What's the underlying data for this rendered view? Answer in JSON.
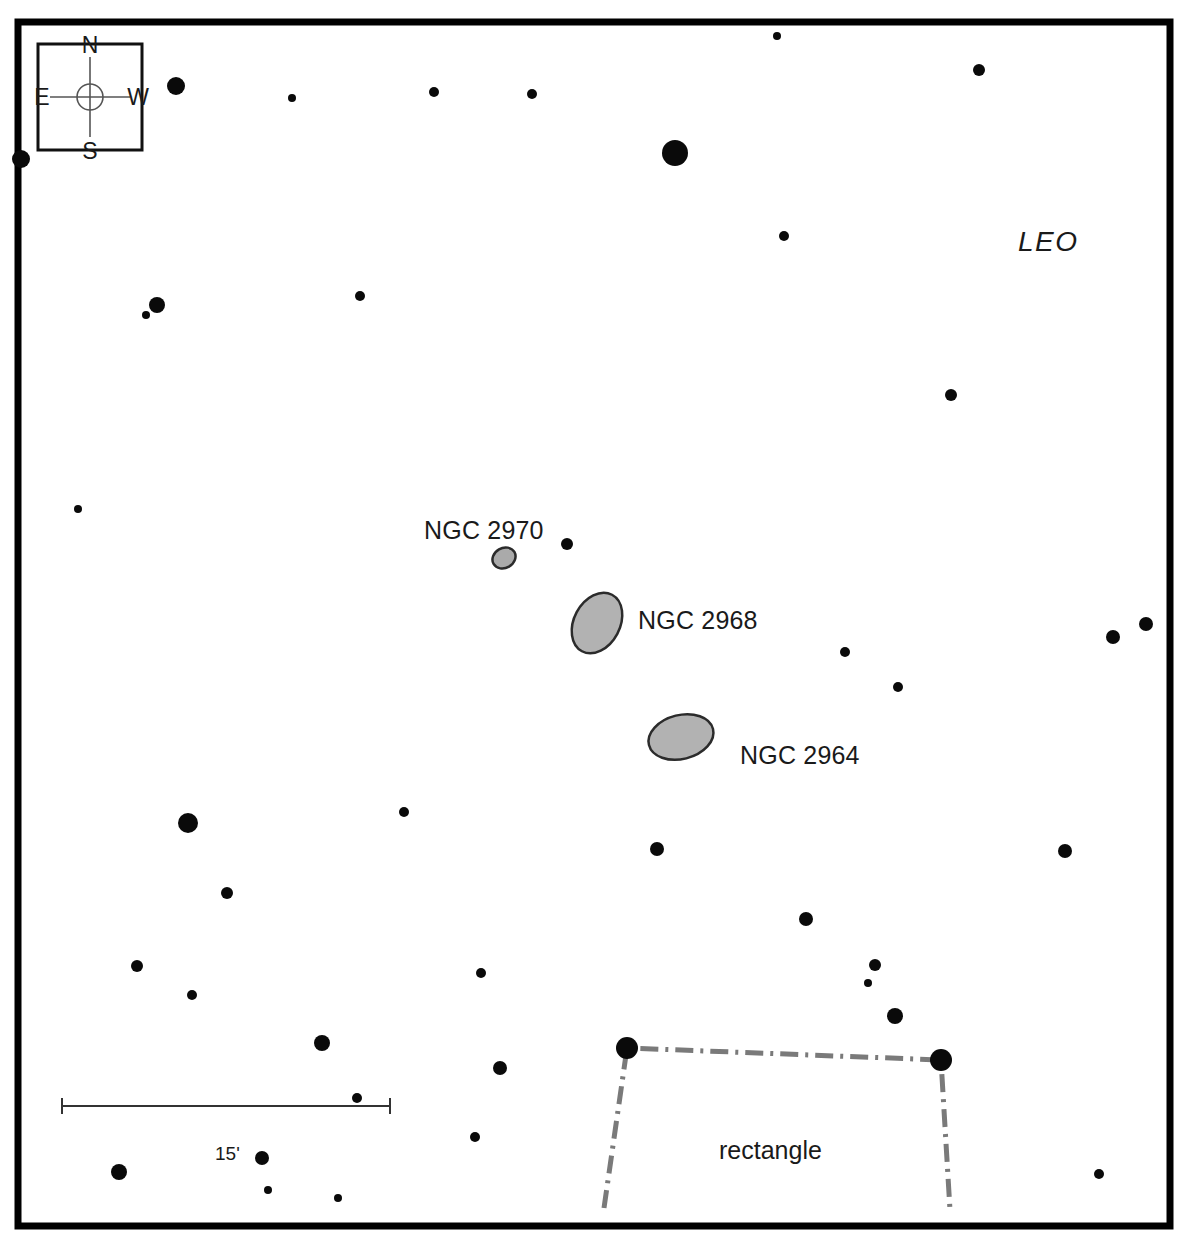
{
  "chart": {
    "width": 1187,
    "height": 1249,
    "background_color": "#ffffff",
    "border_color": "#000000",
    "border_width": 7,
    "frame": {
      "x": 18,
      "y": 22,
      "w": 1152,
      "h": 1204
    }
  },
  "compass": {
    "name": "compass-rose",
    "box": {
      "x": 38,
      "y": 44,
      "w": 104,
      "h": 106
    },
    "north_label": "N",
    "south_label": "S",
    "east_label": "E",
    "west_label": "W",
    "center": {
      "x": 90,
      "y": 97
    },
    "circle_radius": 13,
    "line_color": "#555555",
    "box_border_color": "#111111"
  },
  "constellation": {
    "label": "LEO",
    "x": 1018,
    "y": 226
  },
  "galaxies": [
    {
      "name": "NGC 2970",
      "label": "NGC 2970",
      "label_x": 424,
      "label_y": 516,
      "cx": 504,
      "cy": 558,
      "rx": 12,
      "ry": 10,
      "rotation": -30,
      "fill": "#aaaaaa",
      "stroke": "#2b2b2b"
    },
    {
      "name": "NGC 2968",
      "label": "NGC 2968",
      "label_x": 638,
      "label_y": 606,
      "cx": 597,
      "cy": 623,
      "rx": 23,
      "ry": 32,
      "rotation": 28,
      "fill": "#b2b2b2",
      "stroke": "#2b2b2b"
    },
    {
      "name": "NGC 2964",
      "label": "NGC 2964",
      "label_x": 740,
      "label_y": 741,
      "cx": 681,
      "cy": 737,
      "rx": 33,
      "ry": 22,
      "rotation": -14,
      "fill": "#b2b2b2",
      "stroke": "#2b2b2b"
    }
  ],
  "asterism": {
    "label": "rectangle",
    "label_x": 719,
    "label_y": 1136,
    "line_color": "#7a7a7a",
    "line_width": 5,
    "dash_pattern": "18,7,3,7",
    "vertices": [
      {
        "x": 604,
        "y": 1208
      },
      {
        "x": 627,
        "y": 1048
      },
      {
        "x": 941,
        "y": 1060
      },
      {
        "x": 950,
        "y": 1210
      }
    ]
  },
  "scale_bar": {
    "label": "15'",
    "label_x": 215,
    "label_y": 1143,
    "x1": 62,
    "x2": 390,
    "y": 1106,
    "tick_height": 16,
    "color": "#333333",
    "line_width": 2
  },
  "stars": [
    {
      "x": 176,
      "y": 86,
      "r": 9
    },
    {
      "x": 292,
      "y": 98,
      "r": 4
    },
    {
      "x": 434,
      "y": 92,
      "r": 5
    },
    {
      "x": 532,
      "y": 94,
      "r": 5
    },
    {
      "x": 777,
      "y": 36,
      "r": 4
    },
    {
      "x": 979,
      "y": 70,
      "r": 6
    },
    {
      "x": 675,
      "y": 153,
      "r": 13
    },
    {
      "x": 784,
      "y": 236,
      "r": 5
    },
    {
      "x": 21,
      "y": 159,
      "r": 9
    },
    {
      "x": 157,
      "y": 305,
      "r": 8
    },
    {
      "x": 146,
      "y": 315,
      "r": 4
    },
    {
      "x": 360,
      "y": 296,
      "r": 5
    },
    {
      "x": 951,
      "y": 395,
      "r": 6
    },
    {
      "x": 78,
      "y": 509,
      "r": 4
    },
    {
      "x": 567,
      "y": 544,
      "r": 6
    },
    {
      "x": 1113,
      "y": 637,
      "r": 7
    },
    {
      "x": 1146,
      "y": 624,
      "r": 7
    },
    {
      "x": 845,
      "y": 652,
      "r": 5
    },
    {
      "x": 898,
      "y": 687,
      "r": 5
    },
    {
      "x": 404,
      "y": 812,
      "r": 5
    },
    {
      "x": 188,
      "y": 823,
      "r": 10
    },
    {
      "x": 657,
      "y": 849,
      "r": 7
    },
    {
      "x": 1065,
      "y": 851,
      "r": 7
    },
    {
      "x": 227,
      "y": 893,
      "r": 6
    },
    {
      "x": 192,
      "y": 995,
      "r": 5
    },
    {
      "x": 137,
      "y": 966,
      "r": 6
    },
    {
      "x": 481,
      "y": 973,
      "r": 5
    },
    {
      "x": 806,
      "y": 919,
      "r": 7
    },
    {
      "x": 875,
      "y": 965,
      "r": 6
    },
    {
      "x": 868,
      "y": 983,
      "r": 4
    },
    {
      "x": 895,
      "y": 1016,
      "r": 8
    },
    {
      "x": 322,
      "y": 1043,
      "r": 8
    },
    {
      "x": 500,
      "y": 1068,
      "r": 7
    },
    {
      "x": 357,
      "y": 1098,
      "r": 5
    },
    {
      "x": 475,
      "y": 1137,
      "r": 5
    },
    {
      "x": 262,
      "y": 1158,
      "r": 7
    },
    {
      "x": 119,
      "y": 1172,
      "r": 8
    },
    {
      "x": 268,
      "y": 1190,
      "r": 4
    },
    {
      "x": 338,
      "y": 1198,
      "r": 4
    },
    {
      "x": 1099,
      "y": 1174,
      "r": 5
    },
    {
      "x": 627,
      "y": 1048,
      "r": 11
    },
    {
      "x": 941,
      "y": 1060,
      "r": 11
    }
  ],
  "star_color": "#0a0a0a"
}
